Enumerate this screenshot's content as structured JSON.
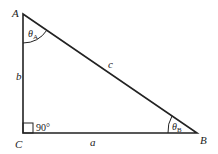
{
  "diagram": {
    "vertices": {
      "A": {
        "label": "A",
        "x": 23,
        "y": 14
      },
      "B": {
        "label": "B",
        "x": 197,
        "y": 133
      },
      "C": {
        "label": "C",
        "x": 23,
        "y": 133
      }
    },
    "sides": {
      "a": {
        "label": "a"
      },
      "b": {
        "label": "b"
      },
      "c": {
        "label": "c"
      }
    },
    "angles": {
      "A": {
        "symbol": "θ",
        "subscript": "A"
      },
      "B": {
        "symbol": "θ",
        "subscript": "B"
      },
      "C": {
        "label": "90°"
      }
    },
    "colors": {
      "stroke": "#222222",
      "background": "#ffffff"
    }
  }
}
